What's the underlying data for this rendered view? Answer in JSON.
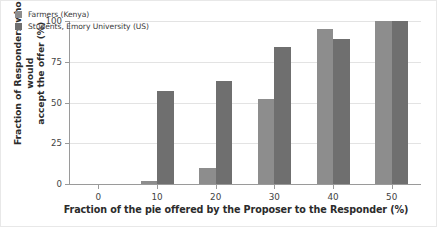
{
  "chart_data": {
    "type": "bar",
    "title": "",
    "xlabel": "Fraction of the pie offered by the Proposer to the Responder (%)",
    "ylabel_line1": "Fraction of Responders who would",
    "ylabel_line2": "accept the offer (%)",
    "categories": [
      "0",
      "10",
      "20",
      "30",
      "40",
      "50"
    ],
    "xtick_labels": [
      "0",
      "10",
      "20",
      "30",
      "40",
      "50"
    ],
    "ytick_labels": [
      "0",
      "25",
      "50",
      "75",
      "100"
    ],
    "ytick_values": [
      0,
      25,
      50,
      75,
      100
    ],
    "ylim": [
      0,
      100
    ],
    "grid": true,
    "legend_position": "upper-left",
    "series": [
      {
        "name": "Farmers (Kenya)",
        "color": "#8d8d8d",
        "values": [
          0,
          2,
          10,
          52,
          95,
          100
        ]
      },
      {
        "name": "Students, Emory University (US)",
        "color": "#6f6f6f",
        "values": [
          0,
          57,
          63,
          84,
          89,
          100
        ]
      }
    ]
  }
}
